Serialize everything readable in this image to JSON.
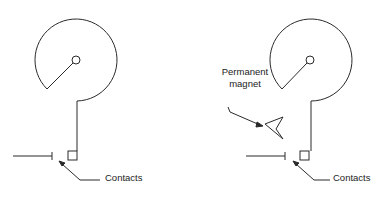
{
  "diagram": {
    "left_panel": {
      "labels": {
        "contacts": "Contacts"
      }
    },
    "right_panel": {
      "labels": {
        "magnet_line1": "Permanent",
        "magnet_line2": "magnet",
        "contacts": "Contacts"
      }
    },
    "colors": {
      "stroke": "#2a2a2a",
      "background": "#ffffff"
    }
  }
}
